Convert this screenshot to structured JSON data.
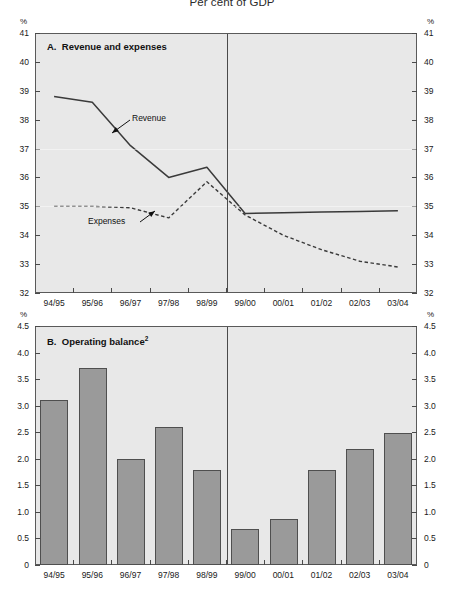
{
  "figure": {
    "title": "Per cent of GDP"
  },
  "panelA": {
    "label_prefix": "A.",
    "label": "Revenue and expenses",
    "unit_left": "%",
    "unit_right": "%",
    "annotations": [
      {
        "name": "revenue",
        "text": "Revenue"
      },
      {
        "name": "expenses",
        "text": "Expenses"
      }
    ]
  },
  "panelB": {
    "label_prefix": "B.",
    "label": "Operating balance",
    "label_superscript": "2",
    "unit_left": "%",
    "unit_right": "%"
  },
  "colors": {
    "plot_background": "#e8e8e8",
    "bar_fill": "#9a9a9a",
    "bar_stroke": "#4f4f4f",
    "axis": "#4a4a4a",
    "series_line": "#3a3a3a",
    "page_background": "#ffffff"
  },
  "chart_data": [
    {
      "type": "line",
      "title": "A.  Revenue and expenses",
      "subtitle": "Per cent of GDP",
      "xlabel": "",
      "ylabel": "%",
      "ylim": [
        32,
        41
      ],
      "yticks": [
        32,
        33,
        34,
        35,
        36,
        37,
        38,
        39,
        40,
        41
      ],
      "ytick_labels": [
        "32",
        "33",
        "34",
        "35",
        "36",
        "37",
        "38",
        "39",
        "40",
        "41"
      ],
      "grid": false,
      "legend": "inline-annotations",
      "categories": [
        "94/95",
        "95/96",
        "96/97",
        "97/98",
        "98/99",
        "99/00",
        "00/01",
        "01/02",
        "02/03",
        "03/04"
      ],
      "forecast_divider_after": "98/99",
      "series": [
        {
          "name": "Revenue",
          "style": "solid",
          "values": [
            38.8,
            38.6,
            37.1,
            36.0,
            36.35,
            34.75,
            34.78,
            34.8,
            34.82,
            34.85
          ]
        },
        {
          "name": "Expenses",
          "style": "dashed",
          "values": [
            35.0,
            35.0,
            34.95,
            34.6,
            35.85,
            34.7,
            34.0,
            33.5,
            33.1,
            32.9
          ]
        }
      ]
    },
    {
      "type": "bar",
      "title": "B.  Operating balance2",
      "xlabel": "",
      "ylabel": "%",
      "ylim": [
        0,
        4.5
      ],
      "yticks": [
        0,
        0.5,
        1.0,
        1.5,
        2.0,
        2.5,
        3.0,
        3.5,
        4.0,
        4.5
      ],
      "ytick_labels": [
        "0",
        "0.5",
        "1.0",
        "1.5",
        "2.0",
        "2.5",
        "3.0",
        "3.5",
        "4.0",
        "4.5"
      ],
      "grid": false,
      "categories": [
        "94/95",
        "95/96",
        "96/97",
        "97/98",
        "98/99",
        "99/00",
        "00/01",
        "01/02",
        "02/03",
        "03/04"
      ],
      "values": [
        3.1,
        3.7,
        2.0,
        2.6,
        1.78,
        0.67,
        0.87,
        1.78,
        2.18,
        2.48
      ],
      "forecast_divider_after": "98/99"
    }
  ]
}
